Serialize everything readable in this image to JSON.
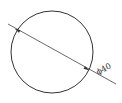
{
  "diagram": {
    "type": "circle-diameter-dimension",
    "circle": {
      "cx": 52,
      "cy": 52,
      "r": 41
    },
    "dimension_line": {
      "x1": 8,
      "y1": 24,
      "x2": 116,
      "y2": 84
    },
    "label": "ϕ40",
    "colors": {
      "stroke": "#333333",
      "background": "#ffffff"
    }
  }
}
